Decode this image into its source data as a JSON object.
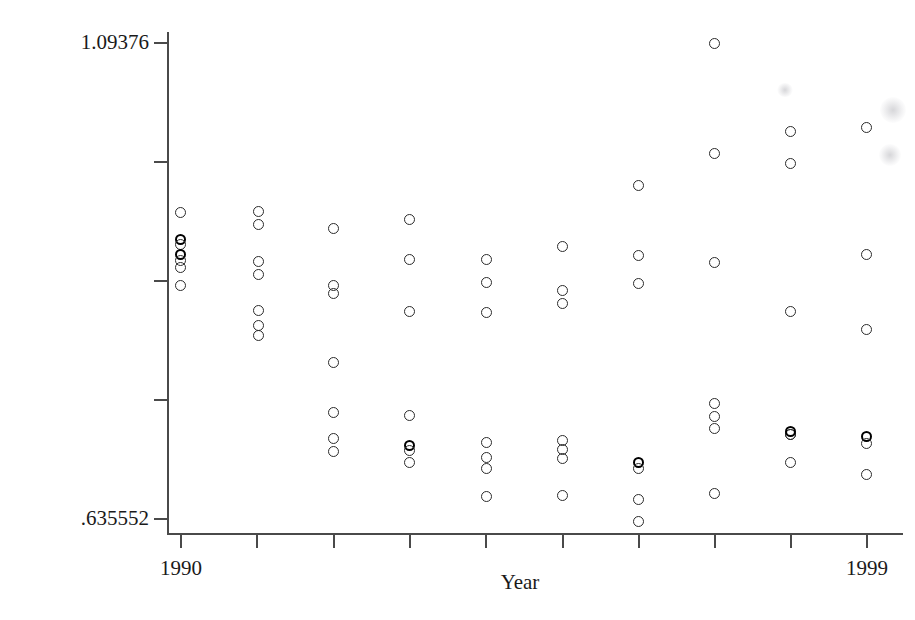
{
  "chart_data": {
    "type": "scatter",
    "title": "",
    "xlabel": "Year",
    "ylabel": "rw_c_bor",
    "xlim": [
      1990,
      1999
    ],
    "ylim": [
      0.635552,
      1.09376
    ],
    "grid": false,
    "legend": null,
    "y_axis": {
      "min_label": ".635552",
      "max_label": "1.09376",
      "min_value": 0.635552,
      "max_value": 1.09376,
      "tick_count": 5
    },
    "x_axis": {
      "min_label": "1990",
      "max_label": "1999",
      "min_value": 1990,
      "max_value": 1999,
      "tick_count": 10
    },
    "marker": "open-circle",
    "categories": [
      1990,
      1991,
      1992,
      1993,
      1994,
      1995,
      1996,
      1997,
      1998,
      1999
    ],
    "points": [
      {
        "x": 1990,
        "y": 0.9367
      },
      {
        "x": 1990,
        "y": 0.9122
      },
      {
        "x": 1990,
        "y": 0.9075
      },
      {
        "x": 1990,
        "y": 0.899
      },
      {
        "x": 1990,
        "y": 0.8934
      },
      {
        "x": 1990,
        "y": 0.8868
      },
      {
        "x": 1990,
        "y": 0.8707
      },
      {
        "x": 1991,
        "y": 0.9376
      },
      {
        "x": 1991,
        "y": 0.9254
      },
      {
        "x": 1991,
        "y": 0.8915
      },
      {
        "x": 1991,
        "y": 0.8793
      },
      {
        "x": 1991,
        "y": 0.8463
      },
      {
        "x": 1991,
        "y": 0.8331
      },
      {
        "x": 1991,
        "y": 0.8237
      },
      {
        "x": 1992,
        "y": 0.9206
      },
      {
        "x": 1992,
        "y": 0.868
      },
      {
        "x": 1992,
        "y": 0.8605
      },
      {
        "x": 1992,
        "y": 0.7975
      },
      {
        "x": 1992,
        "y": 0.7514
      },
      {
        "x": 1992,
        "y": 0.7278
      },
      {
        "x": 1992,
        "y": 0.7156
      },
      {
        "x": 1993,
        "y": 0.9291
      },
      {
        "x": 1993,
        "y": 0.8925
      },
      {
        "x": 1993,
        "y": 0.8444
      },
      {
        "x": 1993,
        "y": 0.7494
      },
      {
        "x": 1993,
        "y": 0.7222
      },
      {
        "x": 1993,
        "y": 0.7175
      },
      {
        "x": 1993,
        "y": 0.7062
      },
      {
        "x": 1994,
        "y": 0.8934
      },
      {
        "x": 1994,
        "y": 0.8718
      },
      {
        "x": 1994,
        "y": 0.8444
      },
      {
        "x": 1994,
        "y": 0.725
      },
      {
        "x": 1994,
        "y": 0.7118
      },
      {
        "x": 1994,
        "y": 0.7015
      },
      {
        "x": 1994,
        "y": 0.6762
      },
      {
        "x": 1995,
        "y": 0.9056
      },
      {
        "x": 1995,
        "y": 0.8651
      },
      {
        "x": 1995,
        "y": 0.8529
      },
      {
        "x": 1995,
        "y": 0.7269
      },
      {
        "x": 1995,
        "y": 0.7184
      },
      {
        "x": 1995,
        "y": 0.71
      },
      {
        "x": 1995,
        "y": 0.6762
      },
      {
        "x": 1996,
        "y": 0.962
      },
      {
        "x": 1996,
        "y": 0.8972
      },
      {
        "x": 1996,
        "y": 0.8718
      },
      {
        "x": 1996,
        "y": 0.7043
      },
      {
        "x": 1996,
        "y": 0.6977
      },
      {
        "x": 1996,
        "y": 0.6686
      },
      {
        "x": 1996,
        "y": 0.6479
      },
      {
        "x": 1997,
        "y": 1.0928
      },
      {
        "x": 1997,
        "y": 0.9902
      },
      {
        "x": 1997,
        "y": 0.8887
      },
      {
        "x": 1997,
        "y": 0.7569
      },
      {
        "x": 1997,
        "y": 0.7447
      },
      {
        "x": 1997,
        "y": 0.7334
      },
      {
        "x": 1997,
        "y": 0.6724
      },
      {
        "x": 1998,
        "y": 1.0468
      },
      {
        "x": 1998,
        "y": 1.0168
      },
      {
        "x": 1998,
        "y": 0.8594
      },
      {
        "x": 1998,
        "y": 0.7447
      },
      {
        "x": 1998,
        "y": 0.7259
      },
      {
        "x": 1998,
        "y": 0.6968
      },
      {
        "x": 1999,
        "y": 1.0337
      },
      {
        "x": 1999,
        "y": 0.8934
      },
      {
        "x": 1999,
        "y": 0.8237
      },
      {
        "x": 1999,
        "y": 0.7241
      },
      {
        "x": 1999,
        "y": 0.7166
      },
      {
        "x": 1999,
        "y": 0.6874
      }
    ]
  },
  "layout": {
    "plot_left": 167,
    "plot_right": 903,
    "plot_top": 32,
    "plot_bottom": 533,
    "y_ticks_px": [
      42,
      161,
      280,
      399,
      518
    ],
    "x_ticks_px": [
      180,
      256,
      333,
      409,
      485,
      562,
      638,
      714,
      790,
      866
    ]
  },
  "markers": [
    {
      "cx": 180,
      "cy": 212,
      "bold": false
    },
    {
      "cx": 180,
      "cy": 239,
      "bold": true
    },
    {
      "cx": 180,
      "cy": 244,
      "bold": false
    },
    {
      "cx": 180,
      "cy": 254,
      "bold": true
    },
    {
      "cx": 180,
      "cy": 260,
      "bold": false
    },
    {
      "cx": 180,
      "cy": 267,
      "bold": false
    },
    {
      "cx": 180,
      "cy": 285,
      "bold": false
    },
    {
      "cx": 258,
      "cy": 211,
      "bold": false
    },
    {
      "cx": 258,
      "cy": 224,
      "bold": false
    },
    {
      "cx": 258,
      "cy": 261,
      "bold": false
    },
    {
      "cx": 258,
      "cy": 274,
      "bold": false
    },
    {
      "cx": 258,
      "cy": 310,
      "bold": false
    },
    {
      "cx": 258,
      "cy": 325,
      "bold": false
    },
    {
      "cx": 258,
      "cy": 335,
      "bold": false
    },
    {
      "cx": 333,
      "cy": 228,
      "bold": false
    },
    {
      "cx": 333,
      "cy": 285,
      "bold": false
    },
    {
      "cx": 333,
      "cy": 293,
      "bold": false
    },
    {
      "cx": 333,
      "cy": 362,
      "bold": false
    },
    {
      "cx": 333,
      "cy": 412,
      "bold": false
    },
    {
      "cx": 333,
      "cy": 438,
      "bold": false
    },
    {
      "cx": 333,
      "cy": 451,
      "bold": false
    },
    {
      "cx": 409,
      "cy": 219,
      "bold": false
    },
    {
      "cx": 409,
      "cy": 259,
      "bold": false
    },
    {
      "cx": 409,
      "cy": 311,
      "bold": false
    },
    {
      "cx": 409,
      "cy": 415,
      "bold": false
    },
    {
      "cx": 409,
      "cy": 445,
      "bold": true
    },
    {
      "cx": 409,
      "cy": 450,
      "bold": false
    },
    {
      "cx": 409,
      "cy": 462,
      "bold": false
    },
    {
      "cx": 486,
      "cy": 259,
      "bold": false
    },
    {
      "cx": 486,
      "cy": 282,
      "bold": false
    },
    {
      "cx": 486,
      "cy": 312,
      "bold": false
    },
    {
      "cx": 486,
      "cy": 442,
      "bold": false
    },
    {
      "cx": 486,
      "cy": 457,
      "bold": false
    },
    {
      "cx": 486,
      "cy": 468,
      "bold": false
    },
    {
      "cx": 486,
      "cy": 496,
      "bold": false
    },
    {
      "cx": 562,
      "cy": 246,
      "bold": false
    },
    {
      "cx": 562,
      "cy": 290,
      "bold": false
    },
    {
      "cx": 562,
      "cy": 303,
      "bold": false
    },
    {
      "cx": 562,
      "cy": 440,
      "bold": false
    },
    {
      "cx": 562,
      "cy": 449,
      "bold": false
    },
    {
      "cx": 562,
      "cy": 458,
      "bold": false
    },
    {
      "cx": 562,
      "cy": 495,
      "bold": false
    },
    {
      "cx": 638,
      "cy": 185,
      "bold": false
    },
    {
      "cx": 638,
      "cy": 255,
      "bold": false
    },
    {
      "cx": 638,
      "cy": 283,
      "bold": false
    },
    {
      "cx": 638,
      "cy": 462,
      "bold": true
    },
    {
      "cx": 638,
      "cy": 468,
      "bold": false
    },
    {
      "cx": 638,
      "cy": 499,
      "bold": false
    },
    {
      "cx": 638,
      "cy": 521,
      "bold": false
    },
    {
      "cx": 714,
      "cy": 43,
      "bold": false
    },
    {
      "cx": 714,
      "cy": 153,
      "bold": false
    },
    {
      "cx": 714,
      "cy": 262,
      "bold": false
    },
    {
      "cx": 714,
      "cy": 403,
      "bold": false
    },
    {
      "cx": 714,
      "cy": 416,
      "bold": false
    },
    {
      "cx": 714,
      "cy": 428,
      "bold": false
    },
    {
      "cx": 714,
      "cy": 493,
      "bold": false
    },
    {
      "cx": 790,
      "cy": 131,
      "bold": false
    },
    {
      "cx": 790,
      "cy": 163,
      "bold": false
    },
    {
      "cx": 790,
      "cy": 311,
      "bold": false
    },
    {
      "cx": 790,
      "cy": 434,
      "bold": false
    },
    {
      "cx": 790,
      "cy": 434,
      "bold": false
    },
    {
      "cx": 790,
      "cy": 431,
      "bold": true
    },
    {
      "cx": 790,
      "cy": 462,
      "bold": false
    },
    {
      "cx": 866,
      "cy": 127,
      "bold": false
    },
    {
      "cx": 866,
      "cy": 254,
      "bold": false
    },
    {
      "cx": 866,
      "cy": 329,
      "bold": false
    },
    {
      "cx": 866,
      "cy": 436,
      "bold": true
    },
    {
      "cx": 866,
      "cy": 443,
      "bold": false
    },
    {
      "cx": 866,
      "cy": 474,
      "bold": false
    }
  ],
  "smudges": [
    {
      "cx": 785,
      "cy": 90,
      "w": 16,
      "h": 14
    },
    {
      "cx": 893,
      "cy": 110,
      "w": 26,
      "h": 26
    },
    {
      "cx": 890,
      "cy": 155,
      "w": 22,
      "h": 22
    }
  ]
}
